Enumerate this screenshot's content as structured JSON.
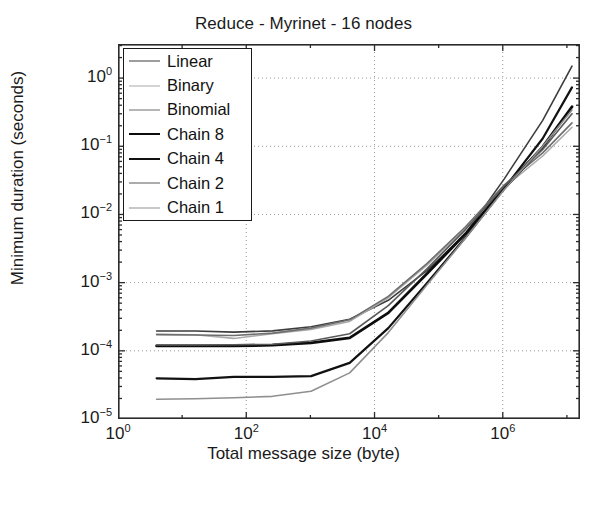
{
  "chart_data": {
    "type": "line",
    "title": "Reduce - Myrinet - 16 nodes",
    "xlabel": "Total message size (byte)",
    "ylabel": "Minimum duration (seconds)",
    "xscale": "log",
    "yscale": "log",
    "xlim": [
      1,
      16000000
    ],
    "ylim": [
      1e-05,
      3.1623
    ],
    "grid": true,
    "legend_position": "upper left",
    "xticks": [
      {
        "value": 1,
        "label": "10",
        "exponent": "0"
      },
      {
        "value": 100,
        "label": "10",
        "exponent": "2"
      },
      {
        "value": 10000,
        "label": "10",
        "exponent": "4"
      },
      {
        "value": 1000000,
        "label": "10",
        "exponent": "6"
      }
    ],
    "yticks": [
      {
        "value": 1,
        "label": "10",
        "exponent": "0"
      },
      {
        "value": 0.1,
        "label": "10",
        "exponent": "−1"
      },
      {
        "value": 0.01,
        "label": "10",
        "exponent": "−2"
      },
      {
        "value": 0.001,
        "label": "10",
        "exponent": "−3"
      },
      {
        "value": 0.0001,
        "label": "10",
        "exponent": "−4"
      },
      {
        "value": 1e-05,
        "label": "10",
        "exponent": "−5"
      }
    ],
    "series": [
      {
        "name": "Linear",
        "color": "#3d3d3d",
        "width": 1.6,
        "x": [
          4,
          16,
          64,
          256,
          1024,
          4096,
          16384,
          65536,
          262144,
          1048576,
          4194304,
          12000000
        ],
        "y": [
          0.000195,
          0.000195,
          0.000188,
          0.000196,
          0.000225,
          0.00029,
          0.00055,
          0.0015,
          0.0052,
          0.033,
          0.24,
          1.5
        ]
      },
      {
        "name": "Binary",
        "color": "#aaaaaa",
        "width": 1.6,
        "x": [
          4,
          16,
          64,
          256,
          1024,
          4096,
          16384,
          65536,
          262144,
          1048576,
          4194304,
          12000000
        ],
        "y": [
          0.000175,
          0.000172,
          0.000152,
          0.000178,
          0.000205,
          0.00027,
          0.0006,
          0.0018,
          0.0062,
          0.025,
          0.072,
          0.19
        ]
      },
      {
        "name": "Binomial",
        "color": "#6e6e6e",
        "width": 1.6,
        "x": [
          4,
          16,
          64,
          256,
          1024,
          4096,
          16384,
          65536,
          262144,
          1048576,
          4194304,
          12000000
        ],
        "y": [
          0.000173,
          0.000171,
          0.000168,
          0.000182,
          0.000215,
          0.000285,
          0.00063,
          0.0019,
          0.0066,
          0.027,
          0.08,
          0.22
        ]
      },
      {
        "name": "Chain 8",
        "color": "#0d0d0d",
        "width": 2.8,
        "x": [
          4,
          16,
          64,
          256,
          1024,
          4096,
          16384,
          65536,
          262144,
          1048576,
          4194304,
          12000000
        ],
        "y": [
          0.000118,
          0.000118,
          0.000118,
          0.000121,
          0.000131,
          0.000155,
          0.00036,
          0.00135,
          0.0052,
          0.024,
          0.098,
          0.38
        ]
      },
      {
        "name": "Chain 4",
        "color": "#111111",
        "width": 2.2,
        "x": [
          4,
          16,
          64,
          256,
          1024,
          4096,
          16384,
          65536,
          262144,
          1048576,
          4194304,
          12000000
        ],
        "y": [
          3.95e-05,
          3.85e-05,
          4.15e-05,
          4.15e-05,
          4.25e-05,
          6.65e-05,
          0.000215,
          0.00098,
          0.0046,
          0.024,
          0.13,
          0.73
        ]
      },
      {
        "name": "Chain 2",
        "color": "#5a5a5a",
        "width": 1.6,
        "x": [
          4,
          16,
          64,
          256,
          1024,
          4096,
          16384,
          65536,
          262144,
          1048576,
          4194304,
          12000000
        ],
        "y": [
          0.000122,
          0.000122,
          0.000123,
          0.000125,
          0.000139,
          0.000178,
          0.00046,
          0.0016,
          0.006,
          0.026,
          0.09,
          0.3
        ]
      },
      {
        "name": "Chain 1",
        "color": "#8f8f8f",
        "width": 1.6,
        "x": [
          4,
          16,
          64,
          256,
          1024,
          4096,
          16384,
          65536,
          262144,
          1048576,
          4194304,
          12000000
        ],
        "y": [
          1.95e-05,
          1.98e-05,
          2.05e-05,
          2.15e-05,
          2.55e-05,
          4.75e-05,
          0.000185,
          0.00092,
          0.0045,
          0.023,
          0.1,
          0.34
        ]
      }
    ]
  },
  "axes": {
    "frame_color": "#2b2b2b",
    "grid_color": "#9a9a9a"
  }
}
